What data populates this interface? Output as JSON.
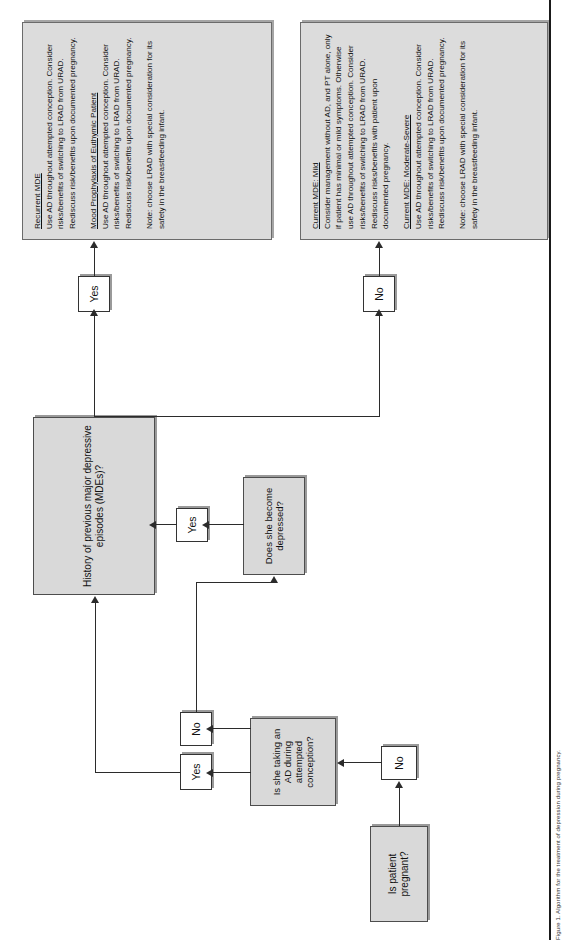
{
  "figure": {
    "orientation": "rotated-90-ccw",
    "caption": "Figure 1. Algorithm for the treatment of depression during pregnancy.",
    "colors": {
      "node_fill": "#d9d9d9",
      "textbox_fill": "#dcdcdc",
      "border": "#4d4d4d",
      "line": "#2b2b2b"
    }
  },
  "nodes": {
    "is_pregnant": {
      "label": "Is patient pregnant?"
    },
    "taking_ad": {
      "label": "Is she taking an AD during attempted conception?"
    },
    "history_mde": {
      "label": "History of previous major depressive episodes (MDEs)?"
    },
    "becomes_depressed": {
      "label": "Does she become depressed?"
    }
  },
  "edge_labels": {
    "pregnant_no": "No",
    "taking_ad_yes": "Yes",
    "taking_ad_no": "No",
    "history_yes": "Yes",
    "history_no": "No",
    "depressed_yes": "Yes"
  },
  "outcome_boxes": [
    {
      "id": "euthymic-outcomes",
      "sections": [
        {
          "heading": "Recurrent MDE",
          "body": "Use AD throughout attempted conception. Consider risks/benefits of switching to LRAD from URAD. Rediscuss risk/benefits upon documented pregnancy."
        },
        {
          "heading": "Mood Prophylaxis of Euthymic Patient",
          "body": "Use AD throughout attempted conception. Consider risks/benefits of switching to LRAD from URAD. Rediscuss risk/benefits upon documented pregnancy."
        }
      ],
      "note": "Note: choose LRAD with special consideration for its safety in the breastfeeding infant."
    },
    {
      "id": "current-mde-outcomes",
      "sections": [
        {
          "heading": "Current MDE: Mild",
          "body": "Consider management without AD, and PT alone, only if patient has minimal or mild symptoms. Otherwise use AD throughout attempted conception. Consider risks/benefits of switching to LRAD from URAD. Rediscuss risks/benefits with patient upon documented pregnancy."
        },
        {
          "heading": "Current MDE: Moderate-Severe",
          "body": "Use AD throughout attempted conception. Consider risks/benefits of switching to LRAD from URAD. Rediscuss risk/benefits upon documented pregnancy."
        }
      ],
      "note": "Note: choose LRAD with special consideration for its safety in the breastfeeding infant."
    }
  ]
}
